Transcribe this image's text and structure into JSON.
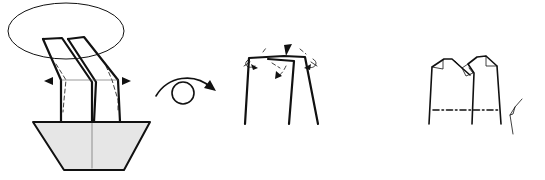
{
  "diagram": {
    "type": "origami-folding-steps",
    "background": "#ffffff",
    "colors": {
      "line": "#111111",
      "paper_back_fill": "#e6e6e6",
      "hairline": "#555555"
    },
    "steps": [
      {
        "id": "step-1",
        "description": "Two tilted flaps standing on a gray trapezoid base; ellipse highlights the top; inward arrowheads on left and right indicate reverse folds along dashed crease lines",
        "symbols": [
          "ellipse-highlight",
          "arrowhead-left",
          "arrowhead-right",
          "valley-fold-dashed-lines",
          "center-crease"
        ]
      },
      {
        "id": "turn-over-symbol",
        "description": "Looped arrow indicating turn the model over",
        "symbols": [
          "turn-over-arrow"
        ]
      },
      {
        "id": "step-2",
        "description": "Close-up of top edge with three small fold arrows and a push-in arrowhead at top center",
        "symbols": [
          "push-arrowhead",
          "fold-arrow-left",
          "fold-arrow-center",
          "fold-arrow-right",
          "dashed-guides"
        ]
      },
      {
        "id": "step-3",
        "description": "Result with small folded corners at the top, and a dash-dot mountain fold line across with mountain-fold symbol at right",
        "symbols": [
          "folded-corners",
          "mountain-fold-line",
          "mountain-fold-symbol"
        ]
      }
    ]
  },
  "accessibility": {
    "summary": "Origami folding diagram showing three steps and a turn-over symbol"
  }
}
